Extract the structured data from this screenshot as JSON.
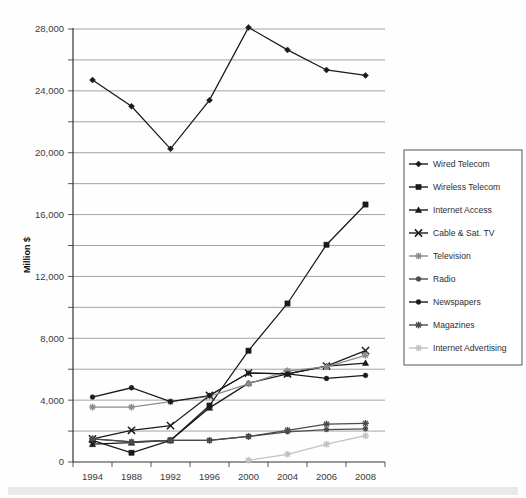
{
  "figure": {
    "title": "",
    "y_axis_title": "Million $",
    "background_color": "#ffffff",
    "plot_border_color": "#000000",
    "gridline_color": "#9a9a9a"
  },
  "chart_data": {
    "type": "line",
    "title": "",
    "xlabel": "",
    "ylabel": "Million $",
    "categories": [
      "1994",
      "1988",
      "1992",
      "1996",
      "2000",
      "2004",
      "2006",
      "2008"
    ],
    "ylim": [
      0,
      28000
    ],
    "ytick_labels": [
      "0",
      "2,000",
      "4,000",
      "6,000",
      "8,000",
      "10,000",
      "12,000",
      "14,000",
      "16,000",
      "18,000",
      "20,000",
      "22,000",
      "24,000",
      "26,000",
      "28,000"
    ],
    "ytick_values": [
      0,
      2000,
      4000,
      6000,
      8000,
      10000,
      12000,
      14000,
      16000,
      18000,
      20000,
      22000,
      24000,
      26000,
      28000
    ],
    "grid": true,
    "legend_position": "right",
    "series": [
      {
        "name": "Wired Telecom",
        "marker": "diamond",
        "color": "#1a1a1a",
        "values": [
          24700,
          23000,
          20250,
          23400,
          28100,
          26650,
          25350,
          25000
        ]
      },
      {
        "name": "Wireless Telecom",
        "marker": "square",
        "color": "#1a1a1a",
        "values": [
          1400,
          600,
          1400,
          3650,
          7200,
          10250,
          14050,
          16650
        ]
      },
      {
        "name": "Internet Access",
        "marker": "triangle",
        "color": "#1a1a1a",
        "values": [
          1150,
          1250,
          1400,
          3500,
          5100,
          5700,
          6200,
          6400
        ]
      },
      {
        "name": "Cable & Sat. TV",
        "marker": "x",
        "color": "#1a1a1a",
        "values": [
          1500,
          2050,
          2350,
          4300,
          5750,
          5700,
          6200,
          7200
        ]
      },
      {
        "name": "Television",
        "marker": "asterisk",
        "color": "#8c8c8c",
        "values": [
          3550,
          3550,
          3900,
          4250,
          5050,
          5900,
          6150,
          6900
        ]
      },
      {
        "name": "Radio",
        "marker": "circle",
        "color": "#4d4d4d",
        "values": [
          1500,
          1300,
          1400,
          1400,
          1650,
          1950,
          2100,
          2150
        ]
      },
      {
        "name": "Newspapers",
        "marker": "circle",
        "color": "#1a1a1a",
        "values": [
          4200,
          4800,
          3900,
          4300,
          5750,
          5700,
          5400,
          5600
        ]
      },
      {
        "name": "Magazines",
        "marker": "asterisk",
        "color": "#4a4a4a",
        "values": [
          1500,
          1300,
          1400,
          1400,
          1650,
          2050,
          2450,
          2500
        ]
      },
      {
        "name": "Internet Advertising",
        "marker": "asterisk",
        "color": "#c2c2c2",
        "values": [
          null,
          null,
          null,
          null,
          120,
          500,
          1150,
          1700
        ]
      }
    ]
  },
  "legend": {
    "items": [
      {
        "label": "Wired Telecom",
        "marker": "diamond",
        "color": "#1a1a1a"
      },
      {
        "label": "Wireless Telecom",
        "marker": "square",
        "color": "#1a1a1a"
      },
      {
        "label": "Internet Access",
        "marker": "triangle",
        "color": "#1a1a1a"
      },
      {
        "label": "Cable & Sat. TV",
        "marker": "x",
        "color": "#1a1a1a"
      },
      {
        "label": "Television",
        "marker": "asterisk",
        "color": "#8c8c8c"
      },
      {
        "label": "Radio",
        "marker": "circle",
        "color": "#4d4d4d"
      },
      {
        "label": "Newspapers",
        "marker": "circle",
        "color": "#1a1a1a"
      },
      {
        "label": "Magazines",
        "marker": "asterisk",
        "color": "#4a4a4a"
      },
      {
        "label": "Internet Advertising",
        "marker": "asterisk",
        "color": "#c2c2c2"
      }
    ]
  }
}
